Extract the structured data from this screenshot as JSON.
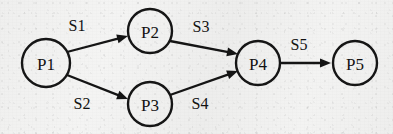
{
  "diagram": {
    "type": "directed-graph",
    "background_color": "#f1f1f0",
    "stroke_color": "#141414",
    "text_color": "#111111",
    "nodes": [
      {
        "id": "P1",
        "label": "P1",
        "cx": 46,
        "cy": 63,
        "r": 24
      },
      {
        "id": "P2",
        "label": "P2",
        "cx": 150,
        "cy": 31,
        "r": 22
      },
      {
        "id": "P3",
        "label": "P3",
        "cx": 150,
        "cy": 104,
        "r": 22
      },
      {
        "id": "P4",
        "label": "P4",
        "cx": 258,
        "cy": 63,
        "r": 22
      },
      {
        "id": "P5",
        "label": "P5",
        "cx": 355,
        "cy": 63,
        "r": 22
      }
    ],
    "edges": [
      {
        "id": "S1",
        "label": "S1",
        "from": "P1",
        "to": "P2",
        "x1": 67,
        "y1": 52,
        "x2": 128,
        "y2": 36,
        "lx": 77,
        "ly": 25
      },
      {
        "id": "S2",
        "label": "S2",
        "from": "P1",
        "to": "P3",
        "x1": 67,
        "y1": 75,
        "x2": 128,
        "y2": 99,
        "lx": 82,
        "ly": 103
      },
      {
        "id": "S3",
        "label": "S3",
        "from": "P2",
        "to": "P4",
        "x1": 170,
        "y1": 41,
        "x2": 238,
        "y2": 54,
        "lx": 201,
        "ly": 26
      },
      {
        "id": "S4",
        "label": "S4",
        "from": "P3",
        "to": "P4",
        "x1": 170,
        "y1": 95,
        "x2": 238,
        "y2": 71,
        "lx": 200,
        "ly": 103
      },
      {
        "id": "S5",
        "label": "S5",
        "from": "P4",
        "to": "P5",
        "x1": 281,
        "y1": 63,
        "x2": 331,
        "y2": 63,
        "lx": 299,
        "ly": 44
      }
    ]
  }
}
